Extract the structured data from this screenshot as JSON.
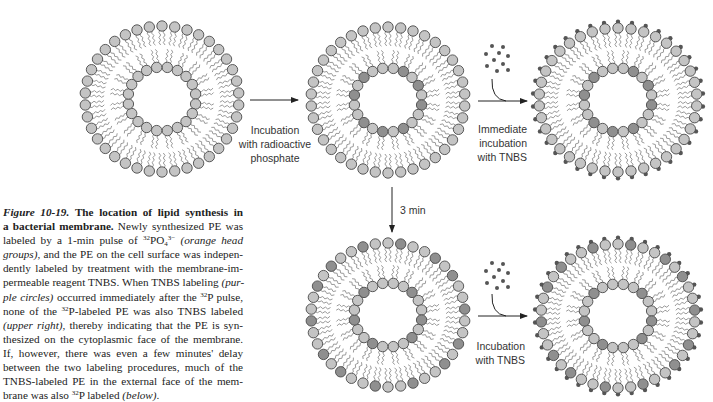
{
  "figure": {
    "number": "Figure 10-19.",
    "caption_lines": [
      [
        {
          "t": "Figure 10-19.",
          "s": "fig-num"
        },
        {
          "t": "   "
        },
        {
          "t": "The location of lipid synthesis in",
          "s": "fig-title"
        }
      ],
      [
        {
          "t": "a bacterial membrane.",
          "s": "fig-title"
        },
        {
          "t": " Newly synthesized PE was"
        }
      ],
      [
        {
          "t": "labeled by a 1-min pulse of "
        },
        {
          "t": "32",
          "s": "sup"
        },
        {
          "t": "PO"
        },
        {
          "t": "4",
          "s": "sub"
        },
        {
          "t": "3−",
          "s": "sup"
        },
        {
          "t": "  "
        },
        {
          "t": "(orange head",
          "s": "i"
        }
      ],
      [
        {
          "t": "groups)",
          "s": "i"
        },
        {
          "t": ", and the PE on the cell surface was indepen-"
        }
      ],
      [
        {
          "t": "dently labeled by treatment with the membrane-im-"
        }
      ],
      [
        {
          "t": "permeable reagent TNBS. When TNBS labeling "
        },
        {
          "t": "(pur-",
          "s": "i"
        }
      ],
      [
        {
          "t": "ple circles)",
          "s": "i"
        },
        {
          "t": " occurred immediately after the "
        },
        {
          "t": "32",
          "s": "sup"
        },
        {
          "t": "P pulse,"
        }
      ],
      [
        {
          "t": "none of the "
        },
        {
          "t": "32",
          "s": "sup"
        },
        {
          "t": "P-labeled PE was also TNBS labeled"
        }
      ],
      [
        {
          "t": "(upper right)",
          "s": "i"
        },
        {
          "t": ", thereby indicating that the PE is syn-"
        }
      ],
      [
        {
          "t": "thesized on the cytoplasmic face of the membrane."
        }
      ],
      [
        {
          "t": "If, however, there was even a few minutes' delay"
        }
      ],
      [
        {
          "t": "between the two labeling procedures, much of the"
        }
      ],
      [
        {
          "t": "TNBS-labeled PE in the external face of the mem-"
        }
      ],
      [
        {
          "t": "brane was also "
        },
        {
          "t": "32",
          "s": "sup"
        },
        {
          "t": "P labeled "
        },
        {
          "t": "(below)",
          "s": "i"
        },
        {
          "t": "."
        }
      ]
    ]
  },
  "colors": {
    "head_unlabeled": "#c4c4c4",
    "head_labeled_32P": "#8f8f8f",
    "head_stroke": "#4a4a4a",
    "tail": "#9a9a9a",
    "tnbs_dot": "#555555",
    "arrow": "#222222",
    "label_text": "#333333"
  },
  "vesicles": [
    {
      "id": "initial",
      "cx": 162,
      "cy": 99,
      "rx": 77,
      "ry": 73,
      "outer_n": 38,
      "inner_n": 20,
      "inner_rx": 34,
      "inner_ry": 32,
      "outer_labeled": [],
      "inner_labeled": [],
      "tnbs": false
    },
    {
      "id": "after-32P-pulse",
      "cx": 388,
      "cy": 100,
      "rx": 77,
      "ry": 73,
      "outer_n": 38,
      "inner_n": 20,
      "inner_rx": 34,
      "inner_ry": 32,
      "outer_labeled": [],
      "inner_labeled": [
        1,
        3,
        5,
        8,
        10,
        12,
        15,
        17
      ],
      "tnbs": false
    },
    {
      "id": "immediate-TNBS",
      "cx": 618,
      "cy": 100,
      "rx": 79,
      "ry": 72,
      "outer_n": 38,
      "inner_n": 20,
      "inner_rx": 34,
      "inner_ry": 32,
      "outer_labeled": [],
      "inner_labeled": [
        1,
        3,
        5,
        8,
        10,
        12,
        15,
        17
      ],
      "tnbs": true
    },
    {
      "id": "after-3-min",
      "cx": 388,
      "cy": 315,
      "rx": 77,
      "ry": 72,
      "outer_n": 38,
      "inner_n": 20,
      "inner_rx": 34,
      "inner_ry": 32,
      "outer_labeled": [
        1,
        4,
        6,
        9,
        12,
        14,
        17,
        20,
        23,
        25,
        28,
        31,
        33,
        36
      ],
      "inner_labeled": [
        2,
        5,
        7,
        11,
        14,
        17
      ],
      "tnbs": false
    },
    {
      "id": "delayed-TNBS",
      "cx": 618,
      "cy": 316,
      "rx": 77,
      "ry": 72,
      "outer_n": 38,
      "inner_n": 20,
      "inner_rx": 34,
      "inner_ry": 32,
      "outer_labeled": [
        1,
        4,
        6,
        9,
        12,
        14,
        17,
        20,
        23,
        25,
        28,
        31,
        33,
        36
      ],
      "inner_labeled": [
        2,
        5,
        7,
        11,
        14,
        17
      ],
      "tnbs": true
    }
  ],
  "arrows": [
    {
      "id": "arrow-incubation-phosphate",
      "x1": 250,
      "y1": 100,
      "x2": 298,
      "y2": 100,
      "curve": false
    },
    {
      "id": "arrow-immediate-tnbs",
      "x1": 478,
      "y1": 101,
      "x2": 527,
      "y2": 101,
      "curve": true
    },
    {
      "id": "arrow-3-min",
      "x1": 392,
      "y1": 187,
      "x2": 392,
      "y2": 232,
      "curve": false
    },
    {
      "id": "arrow-incubation-tnbs",
      "x1": 478,
      "y1": 316,
      "x2": 527,
      "y2": 316,
      "curve": true
    }
  ],
  "tnbs_clusters": [
    {
      "id": "tnbs-cluster-top",
      "dots": [
        [
          492,
          46
        ],
        [
          503,
          47
        ],
        [
          486,
          54
        ],
        [
          499,
          53
        ],
        [
          508,
          56
        ],
        [
          494,
          60
        ],
        [
          503,
          64
        ],
        [
          487,
          66
        ],
        [
          497,
          71
        ],
        [
          508,
          70
        ]
      ]
    },
    {
      "id": "tnbs-cluster-bottom",
      "dots": [
        [
          492,
          263
        ],
        [
          503,
          264
        ],
        [
          486,
          271
        ],
        [
          499,
          270
        ],
        [
          508,
          273
        ],
        [
          494,
          277
        ],
        [
          503,
          281
        ],
        [
          487,
          283
        ],
        [
          497,
          288
        ],
        [
          508,
          287
        ]
      ]
    }
  ],
  "labels": {
    "incubation_phosphate": [
      "Incubation",
      "with radioactive",
      "phosphate"
    ],
    "immediate_tnbs": [
      "Immediate",
      "incubation",
      "with TNBS"
    ],
    "three_min": "3 min",
    "incubation_tnbs": [
      "Incubation",
      "with TNBS"
    ]
  }
}
